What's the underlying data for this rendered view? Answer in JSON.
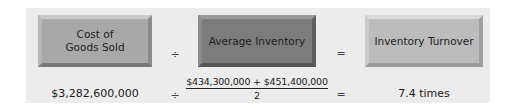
{
  "formula": {
    "numerator_label_line1": "Cost of",
    "numerator_label_line2": "Goods Sold",
    "divide_symbol": "÷",
    "denominator_label": "Average Inventory",
    "equals_symbol": "=",
    "result_label": "Inventory Turnover"
  },
  "calculation": {
    "cost_of_goods_sold": "$3,282,600,000",
    "divide_symbol": "÷",
    "average_inventory_numerator": "$434,300,000 + $451,400,000",
    "average_inventory_denominator": "2",
    "equals_symbol": "=",
    "result": "7.4 times"
  },
  "colors": {
    "panel_background": "#ececec",
    "cost_box": "#a8a8a8",
    "average_box": "#7c7c7c",
    "turnover_box": "#bcbcbc"
  }
}
